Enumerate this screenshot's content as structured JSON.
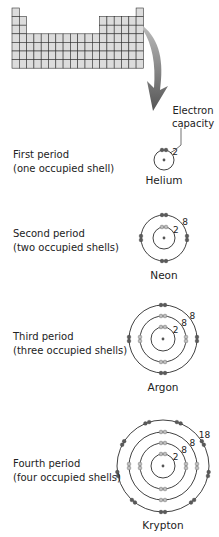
{
  "diagram": {
    "periodic_table": {
      "columns": 18,
      "rows": 7,
      "fill": "#dcdcdc",
      "stroke": "#333333"
    },
    "arrow": {
      "color": "#6b6b6b"
    },
    "capacity_callout": {
      "line1": "Electron",
      "line2": "capacity"
    },
    "colors": {
      "shell_stroke": "#111111",
      "inner_electron": "#bdbdbd",
      "outer_electron": "#5a5a5a",
      "nucleus": "#555555"
    },
    "periods": [
      {
        "line1": "First period",
        "line2": "(one occupied shell)",
        "element": "Helium",
        "shells": [
          2
        ]
      },
      {
        "line1": "Second period",
        "line2": "(two occupied shells)",
        "element": "Neon",
        "shells": [
          2,
          8
        ]
      },
      {
        "line1": "Third period",
        "line2": "(three occupied shells)",
        "element": "Argon",
        "shells": [
          2,
          8,
          8
        ]
      },
      {
        "line1": "Fourth period",
        "line2": "(four occupied shells)",
        "element": "Krypton",
        "shells": [
          2,
          8,
          8,
          18
        ]
      }
    ]
  }
}
